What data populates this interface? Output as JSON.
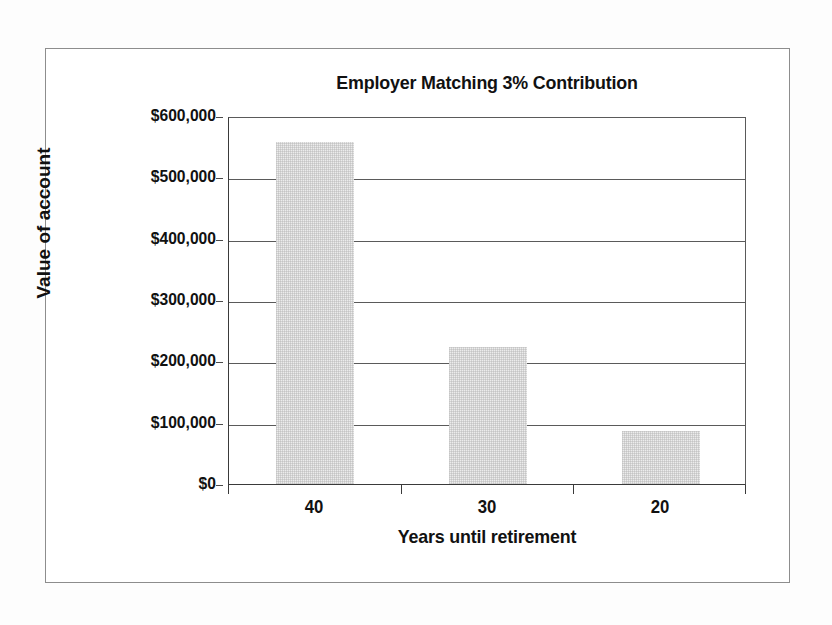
{
  "chart_data": {
    "type": "bar",
    "title": "Employer Matching 3% Contribution",
    "xlabel": "Years until retirement",
    "ylabel": "Value of account",
    "categories": [
      "40",
      "30",
      "20"
    ],
    "values": [
      558000,
      224000,
      86000
    ],
    "ylim": [
      0,
      600000
    ],
    "yticks": [
      0,
      100000,
      200000,
      300000,
      400000,
      500000,
      600000
    ],
    "ytick_labels": [
      "$0",
      "$100,000",
      "$200,000",
      "$300,000",
      "$400,000",
      "$500,000",
      "$600,000"
    ],
    "grid": true,
    "legend": false,
    "series": [
      {
        "name": "Value of account",
        "values": [
          558000,
          224000,
          86000
        ]
      }
    ]
  },
  "style": {
    "bar_fill": "#ececec",
    "bar_pattern": "halftone-dither",
    "gridline_color": "#5a5a5a",
    "axis_color": "#3a3a3a",
    "text_color": "#111111",
    "page_background": "#fdfdfd",
    "plot_background": "#ffffff",
    "frame_border": "#8d8d8d"
  }
}
